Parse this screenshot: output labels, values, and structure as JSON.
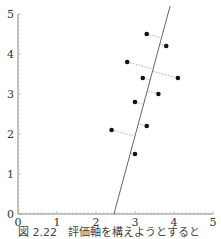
{
  "chart_data": {
    "type": "scatter",
    "title": "",
    "xlabel": "",
    "ylabel": "",
    "xlim": [
      0,
      5
    ],
    "ylim": [
      0,
      5
    ],
    "x_ticks": [
      "0",
      "1",
      "2",
      "3",
      "4",
      "5"
    ],
    "y_ticks": [
      "0",
      "1",
      "2",
      "3",
      "4",
      "5"
    ],
    "grid": false,
    "points": [
      {
        "x": 3.3,
        "y": 4.5
      },
      {
        "x": 3.8,
        "y": 4.2
      },
      {
        "x": 2.8,
        "y": 3.8
      },
      {
        "x": 4.1,
        "y": 3.4
      },
      {
        "x": 3.2,
        "y": 3.4
      },
      {
        "x": 3.6,
        "y": 3.0
      },
      {
        "x": 3.0,
        "y": 2.8
      },
      {
        "x": 2.4,
        "y": 2.1
      },
      {
        "x": 3.3,
        "y": 2.2
      },
      {
        "x": 3.0,
        "y": 1.5
      }
    ],
    "line": {
      "x1": 2.46,
      "y1": 0.0,
      "x2": 3.9,
      "y2": 5.2,
      "description": "candidate evaluation axis"
    },
    "projections": "dotted perpendiculars from each point to the line"
  },
  "caption": "図 2.22　評価軸を構えようとすると"
}
